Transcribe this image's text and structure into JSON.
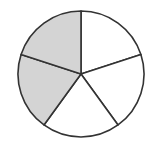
{
  "figure": {
    "type": "fraction-circle",
    "total_parts": 5,
    "shaded_parts": 2,
    "fraction_shaded": "2/5",
    "shaded_color": "#d4d4d4",
    "unshaded_color": "#ffffff",
    "stroke_color": "#333333",
    "center": [
      81,
      74
    ],
    "radius": 63,
    "shaded_slice_indices": [
      3,
      4
    ]
  }
}
